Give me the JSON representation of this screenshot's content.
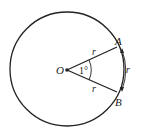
{
  "diagram": {
    "type": "circle-radian",
    "center_label": "O",
    "point_a_label": "A",
    "point_b_label": "B",
    "radius_label_top": "r",
    "radius_label_bottom": "r",
    "arc_label": "r",
    "angle_label": "1°",
    "stroke_color": "#222222",
    "background": "#ffffff"
  }
}
